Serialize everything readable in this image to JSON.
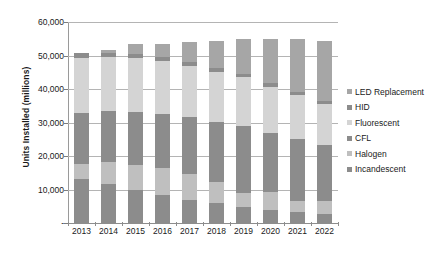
{
  "chart_data": {
    "type": "bar",
    "subtype": "stacked-column",
    "title": "",
    "xlabel": "",
    "ylabel": "Units Installed (millions)",
    "categories": [
      "2013",
      "2014",
      "2015",
      "2016",
      "2017",
      "2018",
      "2019",
      "2020",
      "2021",
      "2022"
    ],
    "ylim": [
      0,
      60000
    ],
    "yticks": [
      0,
      10000,
      20000,
      30000,
      40000,
      50000,
      60000
    ],
    "ytick_labels": [
      "-",
      "10,000",
      "20,000",
      "30,000",
      "40,000",
      "50,000",
      "60,000"
    ],
    "grid": true,
    "legend_position": "right",
    "series": [
      {
        "name": "Incandescent",
        "color": "#8c8c8c",
        "values": [
          13200,
          11500,
          9900,
          8300,
          6800,
          5900,
          4800,
          4000,
          3200,
          2700
        ]
      },
      {
        "name": "Halogen",
        "color": "#bfbfbf",
        "values": [
          4500,
          6800,
          7300,
          8000,
          7800,
          6400,
          4100,
          5200,
          3400,
          3800
        ]
      },
      {
        "name": "CFL",
        "color": "#8c8c8c",
        "values": [
          15200,
          15000,
          16000,
          16300,
          17000,
          18000,
          20000,
          17600,
          18400,
          16700
        ]
      },
      {
        "name": "Fluorescent",
        "color": "#d4d4d4",
        "values": [
          16400,
          16200,
          16000,
          15700,
          15200,
          14800,
          14600,
          13900,
          13100,
          12300
        ]
      },
      {
        "name": "HID",
        "color": "#8c8c8c",
        "values": [
          1500,
          1400,
          1400,
          1300,
          1200,
          1100,
          1000,
          1000,
          900,
          900
        ]
      },
      {
        "name": "LED Replacement",
        "color": "#a6a6a6",
        "values": [
          50,
          900,
          2900,
          3700,
          6000,
          8200,
          10400,
          13100,
          15800,
          17800
        ]
      }
    ],
    "totals": [
      50850,
      51800,
      53500,
      53300,
      54000,
      54400,
      54900,
      54800,
      54800,
      54200
    ]
  },
  "legend": {
    "items": [
      {
        "label": "LED Replacement",
        "color": "#a6a6a6"
      },
      {
        "label": "HID",
        "color": "#8c8c8c"
      },
      {
        "label": "Fluorescent",
        "color": "#d4d4d4"
      },
      {
        "label": "CFL",
        "color": "#8c8c8c"
      },
      {
        "label": "Halogen",
        "color": "#bfbfbf"
      },
      {
        "label": "Incandescent",
        "color": "#8c8c8c"
      }
    ]
  },
  "axes": {
    "y_title": "Units Installed (millions)"
  }
}
